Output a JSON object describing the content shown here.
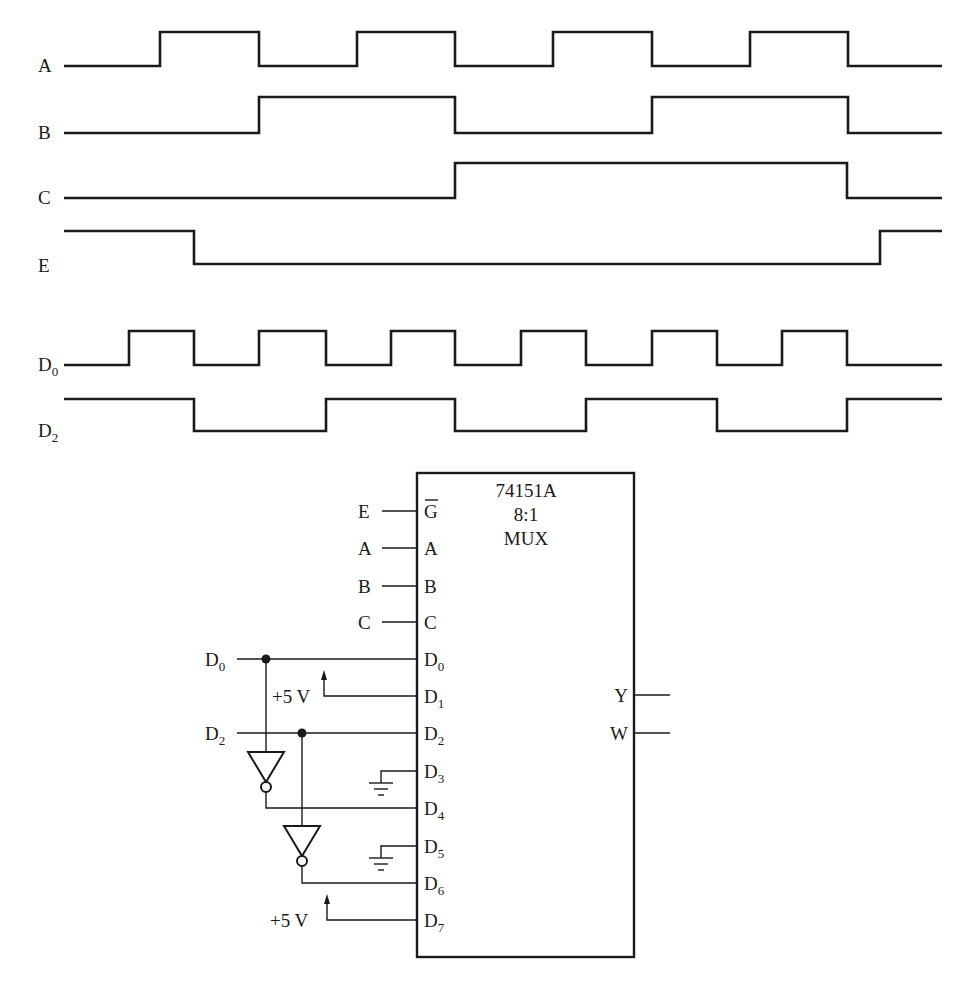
{
  "timing_diagram": {
    "x_start": 64,
    "x_end": 942,
    "signals": [
      {
        "name": "A",
        "label": "A",
        "sub": "",
        "y_low": 66,
        "y_high": 32,
        "initial": 0,
        "edges": [
          160,
          259,
          357,
          455,
          553,
          652,
          750,
          848
        ]
      },
      {
        "name": "B",
        "label": "B",
        "sub": "",
        "y_low": 133,
        "y_high": 97,
        "initial": 0,
        "edges": [
          259,
          455,
          652,
          848
        ]
      },
      {
        "name": "C",
        "label": "C",
        "sub": "",
        "y_low": 198,
        "y_high": 163,
        "initial": 0,
        "edges": [
          455,
          847
        ]
      },
      {
        "name": "E",
        "label": "E",
        "sub": "",
        "y_low": 264,
        "y_high": 231,
        "initial": 1,
        "edges": [
          194,
          880
        ]
      },
      {
        "name": "D0",
        "label": "D",
        "sub": "0",
        "y_low": 365,
        "y_high": 331,
        "initial": 0,
        "edges": [
          129,
          194,
          259,
          326,
          391,
          455,
          521,
          586,
          652,
          717,
          782,
          847
        ]
      },
      {
        "name": "D2",
        "label": "D",
        "sub": "2",
        "y_low": 431,
        "y_high": 399,
        "initial": 1,
        "edges": [
          194,
          326,
          455,
          586,
          717,
          847
        ]
      }
    ]
  },
  "mux": {
    "part_number": "74151A",
    "ratio": "8:1",
    "type": "MUX",
    "box": {
      "x": 417,
      "y": 473,
      "w": 217,
      "h": 484
    },
    "inputs": [
      {
        "pin": "G",
        "pin_bar": true,
        "pin_sub": "",
        "y": 511,
        "source": "E"
      },
      {
        "pin": "A",
        "pin_bar": false,
        "pin_sub": "",
        "y": 548,
        "source": "A"
      },
      {
        "pin": "B",
        "pin_bar": false,
        "pin_sub": "",
        "y": 586,
        "source": "B"
      },
      {
        "pin": "C",
        "pin_bar": false,
        "pin_sub": "",
        "y": 622,
        "source": "C"
      },
      {
        "pin": "D",
        "pin_bar": false,
        "pin_sub": "0",
        "y": 659,
        "source": "D0"
      },
      {
        "pin": "D",
        "pin_bar": false,
        "pin_sub": "1",
        "y": 696,
        "source": "+5 V"
      },
      {
        "pin": "D",
        "pin_bar": false,
        "pin_sub": "2",
        "y": 733,
        "source": "D2"
      },
      {
        "pin": "D",
        "pin_bar": false,
        "pin_sub": "3",
        "y": 771,
        "source": "GND"
      },
      {
        "pin": "D",
        "pin_bar": false,
        "pin_sub": "4",
        "y": 808,
        "source": "NOT D0"
      },
      {
        "pin": "D",
        "pin_bar": false,
        "pin_sub": "5",
        "y": 846,
        "source": "GND"
      },
      {
        "pin": "D",
        "pin_bar": false,
        "pin_sub": "6",
        "y": 883,
        "source": "NOT D2"
      },
      {
        "pin": "D",
        "pin_bar": false,
        "pin_sub": "7",
        "y": 920,
        "source": "+5 V"
      }
    ],
    "outputs": [
      {
        "pin": "Y",
        "y": 695
      },
      {
        "pin": "W",
        "y": 733
      }
    ]
  },
  "external_labels": {
    "E": "E",
    "A": "A",
    "B": "B",
    "C": "C",
    "D0_main": "D",
    "D0_sub": "0",
    "D2_main": "D",
    "D2_sub": "2",
    "vcc_d1": "+5 V",
    "vcc_d7": "+5 V"
  }
}
